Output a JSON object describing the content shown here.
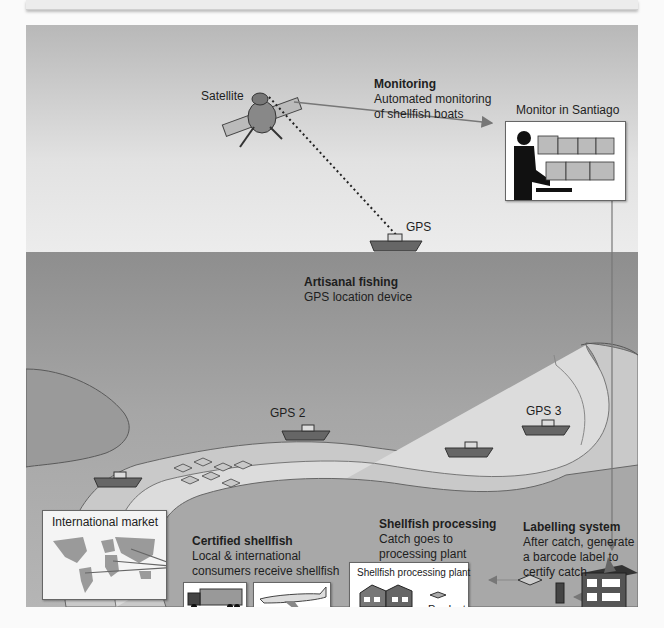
{
  "diagram": {
    "colors": {
      "sky_top": "#b8b8b8",
      "sea": "#a0a0a0",
      "shore": "#d9d9d9",
      "ink": "#1e1e1e"
    },
    "satellite": {
      "label": "Satellite",
      "icon": "satellite-icon"
    },
    "monitoring": {
      "title": "Monitoring",
      "line1": "Automated monitoring",
      "line2": "of shellfish boats"
    },
    "monitor": {
      "label": "Monitor in Santiago",
      "icon": "operator-with-screens-icon"
    },
    "gps_boat": {
      "label": "GPS",
      "icon": "boat-icon"
    },
    "artisanal": {
      "title": "Artisanal fishing",
      "line1": "GPS location device"
    },
    "boats": [
      {
        "label": "GPS 2",
        "icon": "boat-icon"
      },
      {
        "label": "GPS 3",
        "icon": "boat-icon"
      },
      {
        "label": "",
        "icon": "boat-icon"
      },
      {
        "label": "",
        "icon": "boat-icon"
      }
    ],
    "international_market": {
      "label": "International market",
      "icon": "world-map-icon"
    },
    "certified": {
      "title": "Certified shellfish",
      "line1": "Local & international",
      "line2": "consumers receive shellfish",
      "icons": [
        "truck-icon",
        "airplane-icon"
      ]
    },
    "processing": {
      "title": "Shellfish processing",
      "line1": "Catch goes to",
      "line2": "processing plant",
      "plant_label": "Shellfish processing plant",
      "product_label": "Product"
    },
    "labelling": {
      "title": "Labelling system",
      "line1": "After catch, generate",
      "line2": "a barcode label to",
      "line3": "certify catch"
    }
  }
}
